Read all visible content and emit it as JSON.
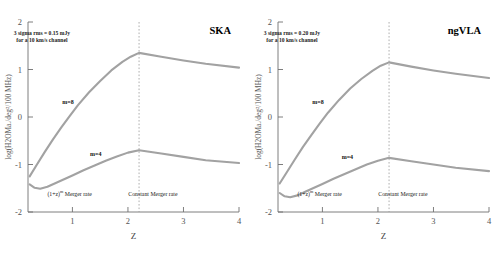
{
  "figure": {
    "width": 500,
    "height": 253,
    "background": "#ffffff",
    "curve_color": "#a2a2a2",
    "axis_color": "#6f6f6f",
    "divider_color": "#9a9a9a"
  },
  "chart_data": [
    {
      "type": "line",
      "title": "SKA",
      "xlabel": "Z",
      "ylabel": "log(H2OMa./deg²/100 MHz)",
      "xlim": [
        0.2,
        4
      ],
      "ylim": [
        -2,
        2
      ],
      "xticks": [
        1,
        2,
        3,
        4
      ],
      "xticklabels": [
        "1",
        "2",
        "3",
        "4"
      ],
      "yticks": [
        -2,
        -1,
        0,
        1,
        2
      ],
      "yticklabels": [
        "-2",
        "-1",
        "0",
        "1",
        "2"
      ],
      "grid": false,
      "legend": "inline-labels",
      "annotations": [
        {
          "name": "sensitivity-note",
          "line1": "3 sigma rms = 0.15 mJy",
          "line2": "for a 10 km/s channel",
          "x": 0.45,
          "y": 1.72
        },
        {
          "name": "merger-rate-evolving",
          "text_pre": "(1+z)",
          "text_sup": "m",
          "text_post": " Merger rate",
          "x": 0.95,
          "y": -1.66
        },
        {
          "name": "merger-rate-constant",
          "text": "Constant Merger rate",
          "x": 2.45,
          "y": -1.66
        },
        {
          "name": "curve-label-m8",
          "text": "m=8",
          "x": 0.92,
          "y": 0.27
        },
        {
          "name": "curve-label-m4",
          "text": "m=4",
          "x": 1.42,
          "y": -0.82
        }
      ],
      "divider_x": 2.2,
      "series": [
        {
          "name": "m=8",
          "points": [
            [
              0.23,
              -1.25
            ],
            [
              0.35,
              -1.02
            ],
            [
              0.5,
              -0.74
            ],
            [
              0.65,
              -0.47
            ],
            [
              0.8,
              -0.22
            ],
            [
              0.95,
              0.02
            ],
            [
              1.1,
              0.25
            ],
            [
              1.3,
              0.52
            ],
            [
              1.5,
              0.76
            ],
            [
              1.7,
              0.98
            ],
            [
              1.9,
              1.16
            ],
            [
              2.05,
              1.27
            ],
            [
              2.2,
              1.35
            ],
            [
              2.6,
              1.27
            ],
            [
              3.0,
              1.19
            ],
            [
              3.4,
              1.12
            ],
            [
              4.0,
              1.04
            ]
          ]
        },
        {
          "name": "m=4",
          "points": [
            [
              0.23,
              -1.42
            ],
            [
              0.32,
              -1.49
            ],
            [
              0.42,
              -1.51
            ],
            [
              0.55,
              -1.47
            ],
            [
              0.7,
              -1.39
            ],
            [
              0.85,
              -1.31
            ],
            [
              1.0,
              -1.23
            ],
            [
              1.2,
              -1.12
            ],
            [
              1.4,
              -1.02
            ],
            [
              1.6,
              -0.92
            ],
            [
              1.8,
              -0.83
            ],
            [
              2.0,
              -0.75
            ],
            [
              2.2,
              -0.7
            ],
            [
              2.6,
              -0.77
            ],
            [
              3.0,
              -0.84
            ],
            [
              3.4,
              -0.91
            ],
            [
              4.0,
              -0.97
            ]
          ]
        }
      ]
    },
    {
      "type": "line",
      "title": "ngVLA",
      "xlabel": "Z",
      "ylabel": "log(H2OMa./deg²/100 MHz)",
      "xlim": [
        0.2,
        4
      ],
      "ylim": [
        -2,
        2
      ],
      "xticks": [
        1,
        2,
        3,
        4
      ],
      "xticklabels": [
        "1",
        "2",
        "3",
        "4"
      ],
      "yticks": [
        -2,
        -1,
        0,
        1,
        2
      ],
      "yticklabels": [
        "-2",
        "-1",
        "0",
        "1",
        "2"
      ],
      "grid": false,
      "legend": "inline-labels",
      "annotations": [
        {
          "name": "sensitivity-note",
          "line1": "3 sigma rms = 0.20 mJy",
          "line2": "for a 10 km/s channel",
          "x": 0.45,
          "y": 1.72
        },
        {
          "name": "merger-rate-evolving",
          "text_pre": "(1+z)",
          "text_sup": "m",
          "text_post": " Merger rate",
          "x": 0.95,
          "y": -1.66
        },
        {
          "name": "merger-rate-constant",
          "text": "Constant Merger rate",
          "x": 2.45,
          "y": -1.66
        },
        {
          "name": "curve-label-m8",
          "text": "m=8",
          "x": 0.92,
          "y": 0.27
        },
        {
          "name": "curve-label-m4",
          "text": "m=4",
          "x": 1.45,
          "y": -0.88
        }
      ],
      "divider_x": 2.2,
      "series": [
        {
          "name": "m=8",
          "points": [
            [
              0.23,
              -1.4
            ],
            [
              0.35,
              -1.18
            ],
            [
              0.5,
              -0.9
            ],
            [
              0.65,
              -0.63
            ],
            [
              0.8,
              -0.38
            ],
            [
              0.95,
              -0.14
            ],
            [
              1.1,
              0.09
            ],
            [
              1.3,
              0.36
            ],
            [
              1.5,
              0.6
            ],
            [
              1.7,
              0.8
            ],
            [
              1.9,
              0.97
            ],
            [
              2.05,
              1.08
            ],
            [
              2.2,
              1.15
            ],
            [
              2.6,
              1.06
            ],
            [
              3.0,
              0.98
            ],
            [
              3.4,
              0.91
            ],
            [
              4.0,
              0.82
            ]
          ]
        },
        {
          "name": "m=4",
          "points": [
            [
              0.23,
              -1.6
            ],
            [
              0.32,
              -1.67
            ],
            [
              0.42,
              -1.69
            ],
            [
              0.55,
              -1.65
            ],
            [
              0.7,
              -1.57
            ],
            [
              0.85,
              -1.49
            ],
            [
              1.0,
              -1.41
            ],
            [
              1.2,
              -1.3
            ],
            [
              1.4,
              -1.2
            ],
            [
              1.6,
              -1.1
            ],
            [
              1.8,
              -1.0
            ],
            [
              2.0,
              -0.92
            ],
            [
              2.2,
              -0.86
            ],
            [
              2.6,
              -0.93
            ],
            [
              3.0,
              -1.0
            ],
            [
              3.4,
              -1.07
            ],
            [
              4.0,
              -1.14
            ]
          ]
        }
      ]
    }
  ]
}
